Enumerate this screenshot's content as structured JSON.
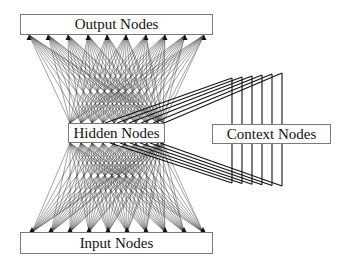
{
  "diagram": {
    "nodes": {
      "output": {
        "label": "Output Nodes",
        "box": [
          20,
          14,
          193,
          21
        ]
      },
      "hidden": {
        "label": "Hidden Nodes",
        "box": [
          68,
          123,
          97,
          20
        ]
      },
      "context": {
        "label": "Context Nodes",
        "box": [
          212,
          124,
          119,
          20
        ]
      },
      "input": {
        "label": "Input Nodes",
        "box": [
          20,
          232,
          193,
          22
        ]
      }
    },
    "connections": {
      "input_to_hidden": {
        "source_y": 232,
        "source_x": [
          32,
          51,
          70,
          89,
          108,
          127,
          146,
          165,
          184,
          203
        ],
        "target_y": 143,
        "target_x": [
          70,
          81,
          92,
          103,
          114,
          125,
          136,
          147,
          158,
          163
        ],
        "style": "fully-connected fan"
      },
      "hidden_to_output": {
        "source_y": 123,
        "source_x": [
          70,
          81,
          92,
          103,
          114,
          125,
          136,
          147,
          158,
          163
        ],
        "target_y": 35,
        "target_x": [
          29,
          48,
          68,
          88,
          107,
          126,
          146,
          165,
          185,
          204
        ],
        "style": "fully-connected fan with arrowheads"
      },
      "hidden_to_context_copy": {
        "count": 6,
        "start_top_x": [
          105,
          117,
          129,
          141,
          153,
          164
        ],
        "start_top_y": 123,
        "vertical_x": [
          232,
          242,
          252,
          262,
          272,
          282
        ],
        "vertical_top_y": [
          78,
          77,
          76,
          75,
          74,
          73
        ],
        "context_top_y": 124
      },
      "context_to_hidden": {
        "count": 6,
        "vertical_x": [
          232,
          242,
          252,
          262,
          272,
          282
        ],
        "context_bottom_y": 144,
        "vertical_bottom_y": [
          183,
          183.6,
          184.2,
          184.8,
          185.4,
          186
        ],
        "end_bottom_x": [
          110,
          120,
          130,
          140,
          150,
          160
        ],
        "end_bottom_y": 143
      }
    },
    "colors": {
      "line": "#333333",
      "thick_line": "#111111",
      "box_border": "#7a7a7a",
      "text": "#111111"
    }
  }
}
